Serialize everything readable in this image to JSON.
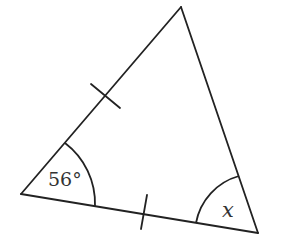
{
  "diagram": {
    "type": "isosceles-triangle",
    "stroke_color": "#222222",
    "label_color": "#333333",
    "vertices": {
      "top": [
        181,
        7
      ],
      "bottom_left": [
        21,
        194
      ],
      "bottom_right": [
        258,
        233
      ]
    },
    "equal_side_marks": [
      "left-side",
      "bottom-side"
    ],
    "angles": {
      "bottom_left": {
        "label": "56°"
      },
      "bottom_right": {
        "label": "x"
      }
    }
  }
}
